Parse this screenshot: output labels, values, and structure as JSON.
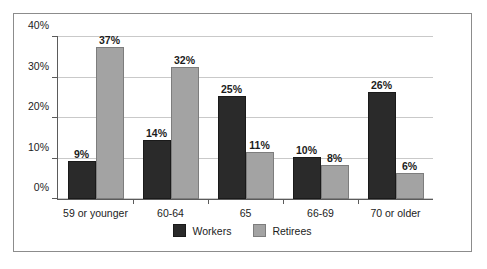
{
  "chart_data": {
    "type": "bar",
    "title": "",
    "xlabel": "",
    "ylabel": "",
    "categories": [
      "59 or younger",
      "60-64",
      "65",
      "66-69",
      "70 or older"
    ],
    "series": [
      {
        "name": "Workers",
        "color": "#2a2a2a",
        "values": [
          9,
          14,
          25,
          10,
          26
        ],
        "labels": [
          "9%",
          "14%",
          "25%",
          "10%",
          "26%"
        ]
      },
      {
        "name": "Retirees",
        "color": "#a3a3a3",
        "values": [
          37,
          32,
          11,
          8,
          6
        ],
        "labels": [
          "37%",
          "32%",
          "11%",
          "8%",
          "6%"
        ]
      }
    ],
    "ylim": [
      0,
      40
    ],
    "yticks": [
      0,
      10,
      20,
      30,
      40
    ],
    "ytick_labels": [
      "0%",
      "10%",
      "20%",
      "30%",
      "40%"
    ],
    "grid": true,
    "legend_position": "bottom-center"
  }
}
